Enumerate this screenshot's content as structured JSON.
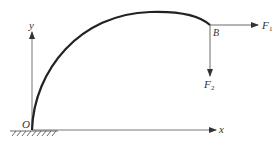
{
  "diagram": {
    "type": "mechanics-curved-beam",
    "colors": {
      "ink": "#222222",
      "axis": "#444444",
      "background": "#ffffff"
    },
    "labels": {
      "origin": "O",
      "x_axis": "x",
      "y_axis": "y",
      "point_b": "B",
      "force_1": "F",
      "force_1_sub": "1",
      "force_2": "F",
      "force_2_sub": "2"
    },
    "elements": {
      "support": "fixed-ground-hatch",
      "beam": "curved arc from O to B",
      "force_1_direction": "horizontal right",
      "force_2_direction": "vertical down"
    }
  }
}
